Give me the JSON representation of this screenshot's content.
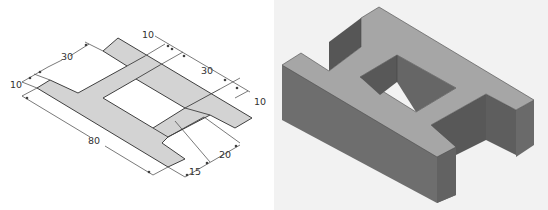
{
  "figure": {
    "left_view": {
      "name": "H-shaped flat pattern (isometric layout with dimensions)",
      "fill_color": "#d3d3d3",
      "line_color": "#404040",
      "dimensions": [
        {
          "label": "10",
          "position": "left-edge-top"
        },
        {
          "label": "30",
          "position": "upper-left"
        },
        {
          "label": "10",
          "position": "top-center"
        },
        {
          "label": "30",
          "position": "upper-right"
        },
        {
          "label": "10",
          "position": "right-edge"
        },
        {
          "label": "80",
          "position": "lower-left-length"
        },
        {
          "label": "15",
          "position": "bottom-center"
        },
        {
          "label": "20",
          "position": "bottom-right"
        }
      ]
    },
    "right_view": {
      "name": "H-shaped solid block (isometric shaded render)",
      "top_face_color": "#a6a6a6",
      "side_face_color": "#6e6e6e",
      "dark_face_color": "#5a5a5a",
      "background": "#f2f2f2"
    }
  }
}
